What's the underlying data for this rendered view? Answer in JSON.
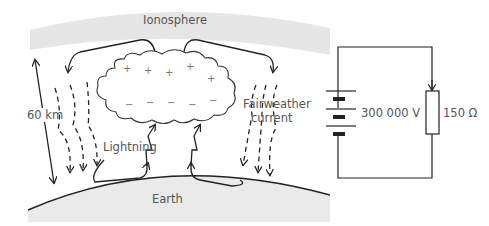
{
  "diagram": {
    "labels": {
      "ionosphere": "Ionosphere",
      "height": "60 km",
      "lightning": "Lightning",
      "fairweather_line1": "Fairweather",
      "fairweather_line2": "current",
      "earth": "Earth"
    },
    "cloud": {
      "positive_sign": "+",
      "negative_sign": "−",
      "positive_count": 6,
      "negative_count": 6
    },
    "circuit": {
      "battery_label": "300 000 V",
      "resistor_label": "150 Ω"
    },
    "colors": {
      "band_fill": "#e6e6e6",
      "earth_fill": "#eaeaea",
      "line": "#222222",
      "text": "#555555"
    }
  }
}
